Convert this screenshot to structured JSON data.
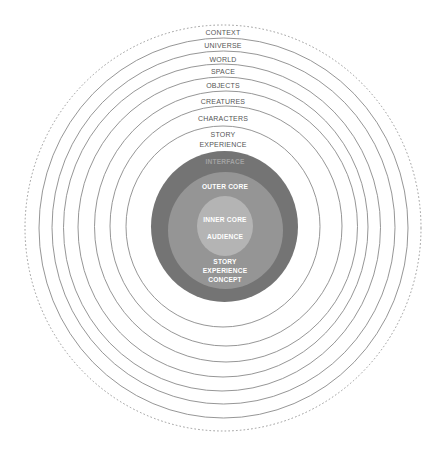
{
  "diagram": {
    "type": "concentric-layers",
    "colors": {
      "background": "#ffffff",
      "ring_stroke": "#8a8a8a",
      "interface_disk": "#747474",
      "outer_core_disk": "#959595",
      "inner_core_disk": "#b4b4b4",
      "outer_label": "#555555",
      "inner_label": "#ffffff",
      "interface_label": "#a2a2a2"
    },
    "outer_rings": [
      {
        "label": "CONTEXT",
        "style": "dotted"
      },
      {
        "label": "UNIVERSE",
        "style": "solid"
      },
      {
        "label": "WORLD",
        "style": "solid"
      },
      {
        "label": "SPACE",
        "style": "solid"
      },
      {
        "label": "OBJECTS",
        "style": "solid"
      },
      {
        "label": "CREATURES",
        "style": "solid"
      },
      {
        "label": "CHARACTERS",
        "style": "solid"
      },
      {
        "label_lines": [
          "STORY",
          "EXPERIENCE"
        ],
        "style": "solid"
      }
    ],
    "interface": {
      "label": "INTERFACE"
    },
    "outer_core": {
      "label": "OUTER CORE",
      "bottom_label_lines": [
        "STORY",
        "EXPERIENCE",
        "CONCEPT"
      ]
    },
    "inner_core": {
      "label": "INNER CORE",
      "sub_label": "AUDIENCE"
    }
  }
}
